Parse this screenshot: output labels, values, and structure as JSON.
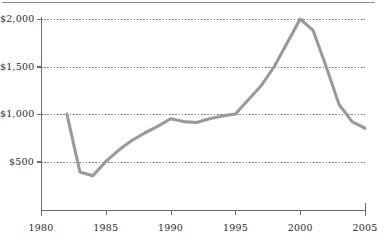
{
  "figure": {
    "name": "line-chart-figure",
    "has_top_rule": true,
    "background_color": "#ffffff"
  },
  "chart_data": {
    "type": "line",
    "title": "",
    "subtitle": "",
    "xlabel": "",
    "ylabel": "",
    "xlim": [
      1980,
      2005
    ],
    "ylim": [
      0,
      2000
    ],
    "grid": true,
    "grid_axis": "y",
    "grid_style": "dotted",
    "legend": false,
    "legend_position": "none",
    "line_color": "#9a9a9a",
    "axis_color": "#6b6b6b",
    "ytick_labels": [
      "$500",
      "$1,000",
      "$1,500",
      "$2,000"
    ],
    "ytick_values": [
      500,
      1000,
      1500,
      2000
    ],
    "xtick_labels": [
      "1980",
      "1985",
      "1990",
      "1995",
      "2000",
      "2005"
    ],
    "xtick_values": [
      1980,
      1985,
      1990,
      1995,
      2000,
      2005
    ],
    "x": [
      1982,
      1983,
      1984,
      1985,
      1986,
      1987,
      1988,
      1989,
      1990,
      1991,
      1992,
      1993,
      1994,
      1995,
      1996,
      1997,
      1998,
      1999,
      2000,
      2001,
      2002,
      2003,
      2004,
      2005
    ],
    "values": [
      1000,
      390,
      350,
      500,
      620,
      720,
      800,
      870,
      950,
      920,
      910,
      950,
      980,
      1000,
      1150,
      1300,
      1500,
      1750,
      2000,
      1880,
      1500,
      1100,
      920,
      850
    ],
    "series": [
      {
        "name": "value",
        "color": "#9a9a9a",
        "values": [
          1000,
          390,
          350,
          500,
          620,
          720,
          800,
          870,
          950,
          920,
          910,
          950,
          980,
          1000,
          1150,
          1300,
          1500,
          1750,
          2000,
          1880,
          1500,
          1100,
          920,
          850
        ]
      }
    ]
  }
}
